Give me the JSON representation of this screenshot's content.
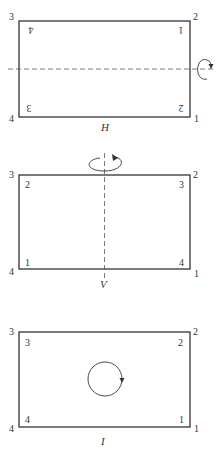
{
  "panels": [
    {
      "id": "H",
      "caption": "H",
      "axis": "horizontal",
      "outer_labels": {
        "top_left": "3",
        "top_right": "2",
        "bottom_left": "4",
        "bottom_right": "1"
      },
      "inner_labels": {
        "top_left": "4",
        "top_right": "1",
        "bottom_left": "3",
        "bottom_right": "2"
      },
      "inner_flipped": true,
      "rotation_icon": "rotation-about-horizontal-axis-icon"
    },
    {
      "id": "V",
      "caption": "V",
      "axis": "vertical",
      "outer_labels": {
        "top_left": "3",
        "top_right": "2",
        "bottom_left": "4",
        "bottom_right": "1"
      },
      "inner_labels": {
        "top_left": "2",
        "top_right": "3",
        "bottom_left": "1",
        "bottom_right": "4"
      },
      "inner_flipped": false,
      "rotation_icon": "rotation-about-vertical-axis-icon"
    },
    {
      "id": "I",
      "caption": "I",
      "axis": "none",
      "outer_labels": {
        "top_left": "3",
        "top_right": "2",
        "bottom_left": "4",
        "bottom_right": "1"
      },
      "inner_labels": {
        "top_left": "3",
        "top_right": "2",
        "bottom_left": "4",
        "bottom_right": "1"
      },
      "inner_flipped": false,
      "rotation_icon": "identity-circle-arrow-icon"
    }
  ],
  "colors": {
    "line": "#333333",
    "dash": "#555555",
    "background": "#ffffff"
  }
}
